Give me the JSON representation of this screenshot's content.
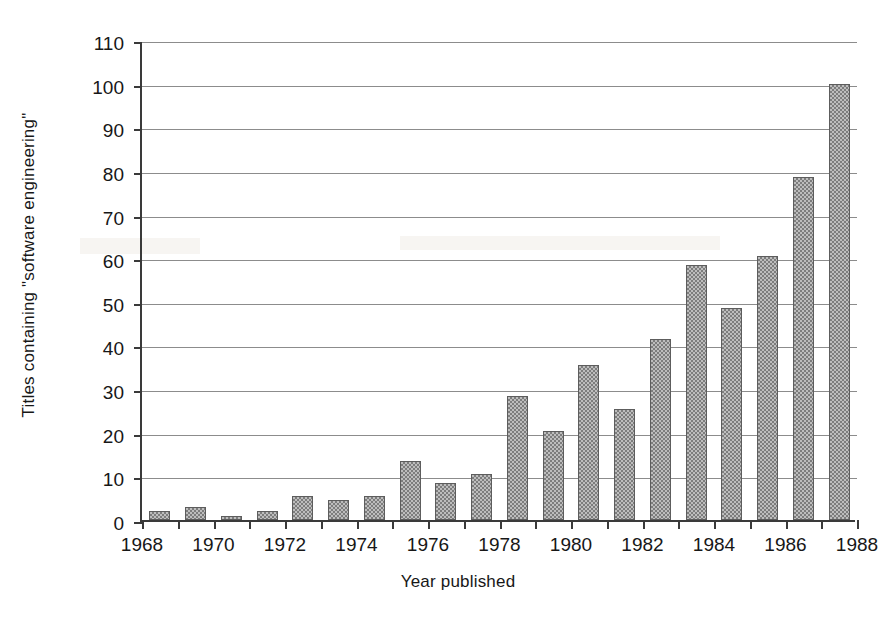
{
  "chart_data": {
    "type": "bar",
    "title": "",
    "xlabel": "Year published",
    "ylabel": "Titles containing \"software engineering\"",
    "categories": [
      1969,
      1970,
      1971,
      1972,
      1973,
      1974,
      1975,
      1976,
      1977,
      1978,
      1979,
      1980,
      1981,
      1982,
      1983,
      1984,
      1985,
      1986,
      1987,
      1988
    ],
    "values": [
      2,
      3,
      1,
      2,
      5.5,
      4.5,
      5.5,
      13.5,
      8.5,
      10.5,
      28.5,
      20.5,
      35.5,
      25.5,
      41.5,
      58.5,
      48.5,
      60.5,
      78.5,
      100
    ],
    "xlim": [
      1968,
      1988
    ],
    "ylim": [
      0,
      110
    ],
    "ytick_values": [
      0,
      10,
      20,
      30,
      40,
      50,
      60,
      70,
      80,
      90,
      100,
      110
    ],
    "ytick_labels": [
      "0",
      "10",
      "20",
      "30",
      "40",
      "50",
      "60",
      "70",
      "80",
      "90",
      "100",
      "110"
    ],
    "xtick_values": [
      1968,
      1969,
      1970,
      1971,
      1972,
      1973,
      1974,
      1975,
      1976,
      1977,
      1978,
      1979,
      1980,
      1981,
      1982,
      1983,
      1984,
      1985,
      1986,
      1987,
      1988
    ],
    "xtick_labeled": [
      1968,
      1970,
      1972,
      1974,
      1976,
      1978,
      1980,
      1982,
      1984,
      1986,
      1988
    ],
    "xtick_labels": [
      "1968",
      "1970",
      "1972",
      "1974",
      "1976",
      "1978",
      "1980",
      "1982",
      "1984",
      "1986",
      "1988"
    ],
    "grid": true,
    "grid_axis": "y",
    "legend": false,
    "bar_fill": "#bdbdbd",
    "bar_edge": "#5d5d5d",
    "grid_color": "#8c8c8c",
    "axis_color": "#3a3a3a"
  }
}
